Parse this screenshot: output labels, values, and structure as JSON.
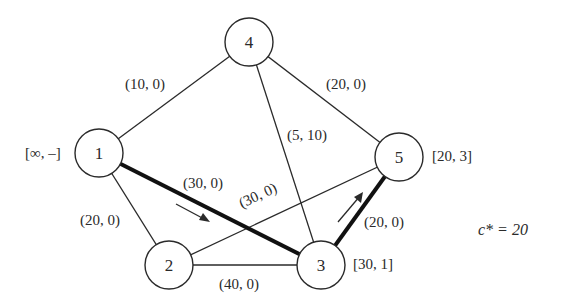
{
  "graph": {
    "nodes": [
      {
        "id": "1",
        "label": "1",
        "cx": 99,
        "cy": 153,
        "tag": "[∞, –]"
      },
      {
        "id": "2",
        "label": "2",
        "cx": 169,
        "cy": 265,
        "tag": ""
      },
      {
        "id": "3",
        "label": "3",
        "cx": 321,
        "cy": 265,
        "tag": "[30, 1]"
      },
      {
        "id": "4",
        "label": "4",
        "cx": 249,
        "cy": 42,
        "tag": ""
      },
      {
        "id": "5",
        "label": "5",
        "cx": 399,
        "cy": 157,
        "tag": "[20, 3]"
      }
    ],
    "edges": [
      {
        "from": "1",
        "to": "4",
        "label": "(10, 0)",
        "bold": false
      },
      {
        "from": "4",
        "to": "5",
        "label": "(20, 0)",
        "bold": false
      },
      {
        "from": "4",
        "to": "3",
        "label": "(5, 10)",
        "bold": false
      },
      {
        "from": "1",
        "to": "3",
        "label": "(30, 0)",
        "bold": true
      },
      {
        "from": "1",
        "to": "2",
        "label": "(20, 0)",
        "bold": false
      },
      {
        "from": "2",
        "to": "5",
        "label": "(30, 0)",
        "bold": false
      },
      {
        "from": "2",
        "to": "3",
        "label": "(40, 0)",
        "bold": false
      },
      {
        "from": "3",
        "to": "5",
        "label": "(20, 0)",
        "bold": true
      }
    ],
    "annotation": "c* = 20"
  },
  "labels": {
    "node1": "1",
    "node2": "2",
    "node3": "3",
    "node4": "4",
    "node5": "5",
    "tag1": "[∞, –]",
    "tag3": "[30, 1]",
    "tag5": "[20, 3]",
    "e14": "(10, 0)",
    "e45": "(20, 0)",
    "e43": "(5, 10)",
    "e13": "(30, 0)",
    "e12": "(20, 0)",
    "e25": "(30, 0)",
    "e23": "(40, 0)",
    "e35": "(20, 0)",
    "cstar": "c* = 20"
  }
}
